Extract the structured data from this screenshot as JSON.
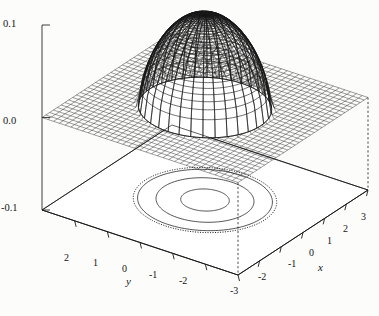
{
  "figure": {
    "kind": "3d-surface-mesh-with-contour",
    "background_color": "#fcfcfb",
    "line_color": "#1a1a1a"
  },
  "chart_data": {
    "type": "surface",
    "title": "",
    "xlabel": "x",
    "ylabel": "y",
    "zlabel": "",
    "grid": false,
    "legend": "none",
    "xlim": [
      -3,
      3
    ],
    "ylim": [
      -3,
      3
    ],
    "zlim": [
      -0.1,
      0.1
    ],
    "x_ticks": [
      -2,
      -1,
      0,
      1,
      2,
      3
    ],
    "x_tick_labels": [
      "-2",
      "-1",
      "0",
      "1",
      "2",
      "3"
    ],
    "y_ticks": [
      2,
      1,
      0,
      -1,
      -2,
      -3
    ],
    "y_tick_labels": [
      "2",
      "1",
      "0",
      "-1",
      "-2",
      "-3"
    ],
    "z_ticks": [
      -0.1,
      0.0,
      0.1
    ],
    "z_tick_labels": [
      "-0.1",
      "0.0",
      "0.1"
    ],
    "surface": {
      "peak_value": 0.1,
      "peak_x": 0,
      "peak_y": 0,
      "support_radius": 1.7,
      "base_level": 0.0,
      "mesh_lines_u": 34,
      "mesh_lines_v": 30
    },
    "contours": {
      "plane_z": -0.1,
      "levels": [
        0.02,
        0.05,
        0.08
      ],
      "radii": [
        1.72,
        1.25,
        0.62
      ],
      "dotted_outline_radius": 1.83,
      "styles": [
        "dotted",
        "solid",
        "solid",
        "solid"
      ]
    },
    "dropline_guides": [
      {
        "from_z": 0.0,
        "to_z": -0.1,
        "at_x": -3,
        "at_y": -3,
        "style": "dashed"
      },
      {
        "from_z": 0.0,
        "to_z": -0.1,
        "at_x": 3,
        "at_y": -3,
        "style": "dashed"
      }
    ]
  },
  "axes": {
    "z": {
      "ticks": [
        {
          "label": "0.1",
          "x": 3,
          "y": 19
        },
        {
          "label": "0.0",
          "x": 3,
          "y": 116
        },
        {
          "label": "-0.1",
          "x": 1,
          "y": 203
        }
      ]
    },
    "y": {
      "title": {
        "text": "y",
        "x": 126,
        "y": 276
      },
      "ticks": [
        {
          "label": "2",
          "x": 64,
          "y": 253
        },
        {
          "label": "1",
          "x": 93,
          "y": 258
        },
        {
          "label": "0",
          "x": 122,
          "y": 264
        },
        {
          "label": "-1",
          "x": 149,
          "y": 270
        },
        {
          "label": "-2",
          "x": 179,
          "y": 276
        },
        {
          "label": "-3",
          "x": 230,
          "y": 286
        }
      ]
    },
    "x": {
      "title": {
        "text": "x",
        "x": 318,
        "y": 262
      },
      "ticks": [
        {
          "label": "-2",
          "x": 258,
          "y": 272
        },
        {
          "label": "-1",
          "x": 288,
          "y": 259
        },
        {
          "label": "0",
          "x": 309,
          "y": 248
        },
        {
          "label": "1",
          "x": 327,
          "y": 236
        },
        {
          "label": "2",
          "x": 343,
          "y": 224
        },
        {
          "label": "3",
          "x": 361,
          "y": 212
        }
      ]
    }
  }
}
